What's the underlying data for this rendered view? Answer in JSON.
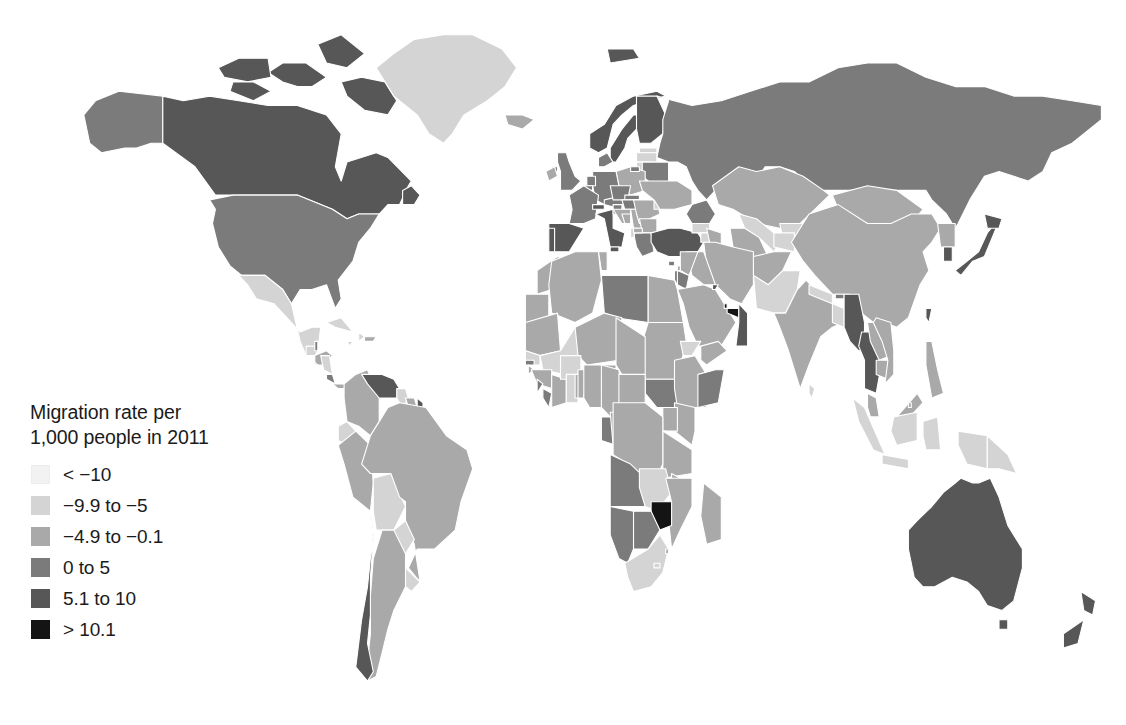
{
  "figure": {
    "kind": "choropleth-world-map",
    "background_color": "#ffffff"
  },
  "legend": {
    "title": "Migration rate per\n1,000 people in 2011",
    "title_line_1": "Migration rate per",
    "title_line_2": "1,000 people in 2011",
    "items": [
      {
        "label": "< −10",
        "color": "#f2f2f2",
        "min": null,
        "max": -10
      },
      {
        "label": "−9.9 to −5",
        "color": "#d4d4d4",
        "min": -9.9,
        "max": -5
      },
      {
        "label": "−4.9 to −0.1",
        "color": "#a9a9a9",
        "min": -4.9,
        "max": -0.1
      },
      {
        "label": "0 to 5",
        "color": "#7b7b7b",
        "min": 0,
        "max": 5
      },
      {
        "label": "5.1 to 10",
        "color": "#575757",
        "min": 5.1,
        "max": 10
      },
      {
        "label": "> 10.1",
        "color": "#141414",
        "min": 10.1,
        "max": null
      }
    ]
  },
  "chart_data": {
    "type": "map",
    "title": "Migration rate per 1,000 people in 2011",
    "subtitle": "",
    "xlabel": "",
    "ylabel": "",
    "projection": "equirectangular-world",
    "value_unit": "net migrants per 1,000 people",
    "year": 2011,
    "grid": false,
    "legend_position": "lower-left-over-map",
    "class_colors": [
      "#f2f2f2",
      "#d4d4d4",
      "#a9a9a9",
      "#7b7b7b",
      "#575757",
      "#141414"
    ],
    "class_labels": [
      "< −10",
      "−9.9 to −5",
      "−4.9 to −0.1",
      "0 to 5",
      "5.1 to 10",
      "> 10.1"
    ],
    "ocean_color": "#ffffff",
    "border_color": "#ffffff",
    "regions": [
      {
        "name": "Canada",
        "class": 4
      },
      {
        "name": "United States",
        "class": 3
      },
      {
        "name": "Greenland",
        "class": 1
      },
      {
        "name": "Alaska",
        "class": 3
      },
      {
        "name": "Mexico",
        "class": 1
      },
      {
        "name": "Guatemala",
        "class": 1
      },
      {
        "name": "Belize",
        "class": 3
      },
      {
        "name": "Honduras",
        "class": 2
      },
      {
        "name": "El Salvador",
        "class": 1
      },
      {
        "name": "Nicaragua",
        "class": 1
      },
      {
        "name": "Costa Rica",
        "class": 3
      },
      {
        "name": "Panama",
        "class": 2
      },
      {
        "name": "Cuba",
        "class": 1
      },
      {
        "name": "Jamaica",
        "class": 1
      },
      {
        "name": "Haiti",
        "class": 1
      },
      {
        "name": "Dominican Republic",
        "class": 2
      },
      {
        "name": "Colombia",
        "class": 2
      },
      {
        "name": "Venezuela",
        "class": 4
      },
      {
        "name": "Guyana",
        "class": 1
      },
      {
        "name": "Suriname",
        "class": 2
      },
      {
        "name": "French Guiana",
        "class": 4
      },
      {
        "name": "Ecuador",
        "class": 1
      },
      {
        "name": "Peru",
        "class": 2
      },
      {
        "name": "Bolivia",
        "class": 1
      },
      {
        "name": "Brazil",
        "class": 2
      },
      {
        "name": "Paraguay",
        "class": 1
      },
      {
        "name": "Uruguay",
        "class": 1
      },
      {
        "name": "Argentina",
        "class": 2
      },
      {
        "name": "Chile",
        "class": 4
      },
      {
        "name": "United Kingdom",
        "class": 3
      },
      {
        "name": "Ireland",
        "class": 2
      },
      {
        "name": "Norway",
        "class": 4
      },
      {
        "name": "Sweden",
        "class": 4
      },
      {
        "name": "Finland",
        "class": 4
      },
      {
        "name": "Denmark",
        "class": 3
      },
      {
        "name": "Iceland",
        "class": 2
      },
      {
        "name": "Estonia",
        "class": 1
      },
      {
        "name": "Latvia",
        "class": 1
      },
      {
        "name": "Lithuania",
        "class": 1
      },
      {
        "name": "Belarus",
        "class": 3
      },
      {
        "name": "Poland",
        "class": 2
      },
      {
        "name": "Germany",
        "class": 3
      },
      {
        "name": "Netherlands",
        "class": 3
      },
      {
        "name": "Belgium",
        "class": 3
      },
      {
        "name": "France",
        "class": 3
      },
      {
        "name": "Spain",
        "class": 4
      },
      {
        "name": "Portugal",
        "class": 4
      },
      {
        "name": "Italy",
        "class": 4
      },
      {
        "name": "Switzerland",
        "class": 4
      },
      {
        "name": "Austria",
        "class": 3
      },
      {
        "name": "Czechia",
        "class": 3
      },
      {
        "name": "Slovakia",
        "class": 3
      },
      {
        "name": "Hungary",
        "class": 3
      },
      {
        "name": "Slovenia",
        "class": 3
      },
      {
        "name": "Croatia",
        "class": 2
      },
      {
        "name": "Bosnia and Herzegovina",
        "class": 2
      },
      {
        "name": "Serbia",
        "class": 2
      },
      {
        "name": "Romania",
        "class": 2
      },
      {
        "name": "Bulgaria",
        "class": 2
      },
      {
        "name": "Greece",
        "class": 3
      },
      {
        "name": "Albania",
        "class": 1
      },
      {
        "name": "North Macedonia",
        "class": 2
      },
      {
        "name": "Moldova",
        "class": 1
      },
      {
        "name": "Ukraine",
        "class": 2
      },
      {
        "name": "Russia",
        "class": 3
      },
      {
        "name": "Turkey",
        "class": 4
      },
      {
        "name": "Georgia",
        "class": 1
      },
      {
        "name": "Armenia",
        "class": 1
      },
      {
        "name": "Azerbaijan",
        "class": 2
      },
      {
        "name": "Kazakhstan",
        "class": 2
      },
      {
        "name": "Uzbekistan",
        "class": 1
      },
      {
        "name": "Turkmenistan",
        "class": 2
      },
      {
        "name": "Kyrgyzstan",
        "class": 1
      },
      {
        "name": "Tajikistan",
        "class": 1
      },
      {
        "name": "Mongolia",
        "class": 2
      },
      {
        "name": "China",
        "class": 2
      },
      {
        "name": "North Korea",
        "class": 2
      },
      {
        "name": "South Korea",
        "class": 4
      },
      {
        "name": "Japan",
        "class": 4
      },
      {
        "name": "Taiwan",
        "class": 4
      },
      {
        "name": "Afghanistan",
        "class": 2
      },
      {
        "name": "Pakistan",
        "class": 1
      },
      {
        "name": "India",
        "class": 2
      },
      {
        "name": "Nepal",
        "class": 1
      },
      {
        "name": "Bhutan",
        "class": 3
      },
      {
        "name": "Bangladesh",
        "class": 1
      },
      {
        "name": "Myanmar",
        "class": 4
      },
      {
        "name": "Thailand",
        "class": 4
      },
      {
        "name": "Laos",
        "class": 2
      },
      {
        "name": "Cambodia",
        "class": 2
      },
      {
        "name": "Vietnam",
        "class": 2
      },
      {
        "name": "Malaysia",
        "class": 2
      },
      {
        "name": "Indonesia",
        "class": 1
      },
      {
        "name": "Philippines",
        "class": 2
      },
      {
        "name": "Papua New Guinea",
        "class": 1
      },
      {
        "name": "Brunei",
        "class": 2
      },
      {
        "name": "Sri Lanka",
        "class": 1
      },
      {
        "name": "Iran",
        "class": 2
      },
      {
        "name": "Iraq",
        "class": 2
      },
      {
        "name": "Syria",
        "class": 2
      },
      {
        "name": "Lebanon",
        "class": 2
      },
      {
        "name": "Israel",
        "class": 3
      },
      {
        "name": "Jordan",
        "class": 3
      },
      {
        "name": "Saudi Arabia",
        "class": 2
      },
      {
        "name": "Kuwait",
        "class": 4
      },
      {
        "name": "Qatar",
        "class": 5
      },
      {
        "name": "United Arab Emirates",
        "class": 5
      },
      {
        "name": "Oman",
        "class": 4
      },
      {
        "name": "Yemen",
        "class": 2
      },
      {
        "name": "Morocco",
        "class": 2
      },
      {
        "name": "Western Sahara",
        "class": 2
      },
      {
        "name": "Algeria",
        "class": 2
      },
      {
        "name": "Tunisia",
        "class": 2
      },
      {
        "name": "Libya",
        "class": 3
      },
      {
        "name": "Egypt",
        "class": 2
      },
      {
        "name": "Sudan",
        "class": 2
      },
      {
        "name": "South Sudan",
        "class": 3
      },
      {
        "name": "Eritrea",
        "class": 1
      },
      {
        "name": "Djibouti",
        "class": 3
      },
      {
        "name": "Ethiopia",
        "class": 2
      },
      {
        "name": "Somalia",
        "class": 3
      },
      {
        "name": "Kenya",
        "class": 2
      },
      {
        "name": "Uganda",
        "class": 2
      },
      {
        "name": "Rwanda",
        "class": 1
      },
      {
        "name": "Burundi",
        "class": 2
      },
      {
        "name": "Tanzania",
        "class": 2
      },
      {
        "name": "Mauritania",
        "class": 2
      },
      {
        "name": "Mali",
        "class": 1
      },
      {
        "name": "Niger",
        "class": 2
      },
      {
        "name": "Chad",
        "class": 2
      },
      {
        "name": "Senegal",
        "class": 1
      },
      {
        "name": "Gambia",
        "class": 3
      },
      {
        "name": "Guinea-Bissau",
        "class": 2
      },
      {
        "name": "Guinea",
        "class": 2
      },
      {
        "name": "Sierra Leone",
        "class": 3
      },
      {
        "name": "Liberia",
        "class": 3
      },
      {
        "name": "Ivory Coast",
        "class": 2
      },
      {
        "name": "Burkina Faso",
        "class": 1
      },
      {
        "name": "Ghana",
        "class": 1
      },
      {
        "name": "Togo",
        "class": 2
      },
      {
        "name": "Benin",
        "class": 2
      },
      {
        "name": "Nigeria",
        "class": 2
      },
      {
        "name": "Cameroon",
        "class": 2
      },
      {
        "name": "Central African Republic",
        "class": 2
      },
      {
        "name": "Equatorial Guinea",
        "class": 3
      },
      {
        "name": "Gabon",
        "class": 3
      },
      {
        "name": "Republic of the Congo",
        "class": 2
      },
      {
        "name": "Democratic Republic of the Congo",
        "class": 2
      },
      {
        "name": "Angola",
        "class": 3
      },
      {
        "name": "Zambia",
        "class": 1
      },
      {
        "name": "Malawi",
        "class": 2
      },
      {
        "name": "Mozambique",
        "class": 2
      },
      {
        "name": "Zimbabwe",
        "class": 5
      },
      {
        "name": "Botswana",
        "class": 3
      },
      {
        "name": "Namibia",
        "class": 3
      },
      {
        "name": "South Africa",
        "class": 1
      },
      {
        "name": "Lesotho",
        "class": 1
      },
      {
        "name": "Eswatini",
        "class": 2
      },
      {
        "name": "Madagascar",
        "class": 2
      },
      {
        "name": "Australia",
        "class": 4
      },
      {
        "name": "New Zealand",
        "class": 4
      }
    ]
  }
}
